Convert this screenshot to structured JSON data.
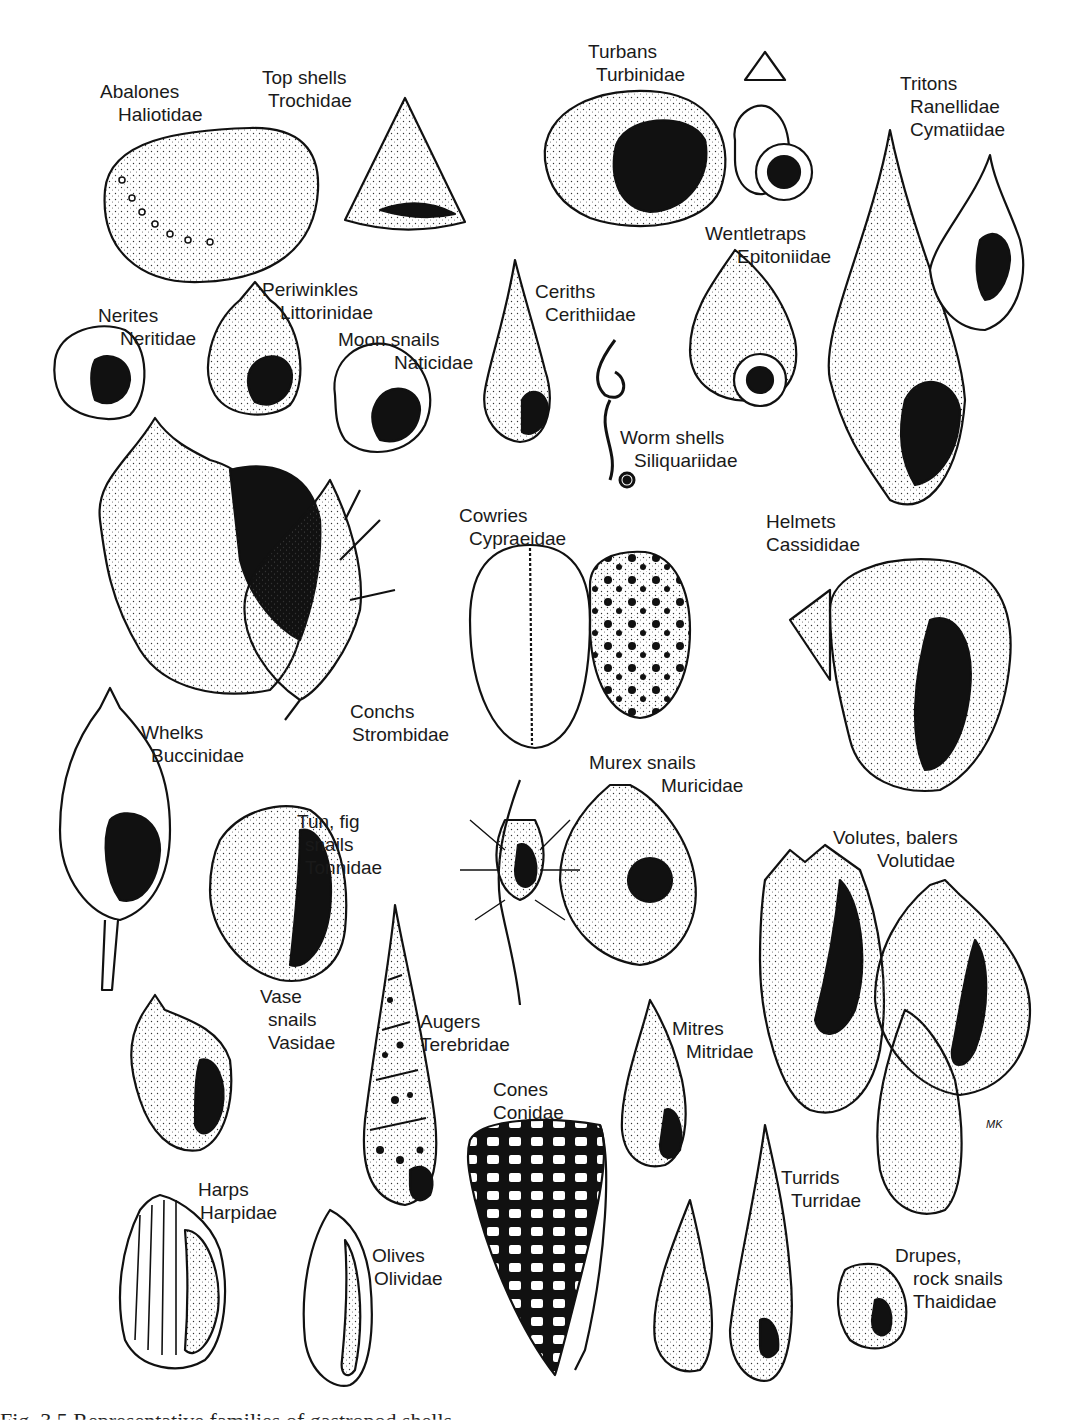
{
  "figure": {
    "caption_partial": "Fig. 3.5 Representative families of gastropod shells",
    "signature": "MK"
  },
  "labels": [
    {
      "id": "abalones",
      "common": "Abalones",
      "family": "Haliotidae",
      "x": 100,
      "y": 80,
      "indent": 18
    },
    {
      "id": "top-shells",
      "common": "Top shells",
      "family": "Trochidae",
      "x": 262,
      "y": 66,
      "indent": 6
    },
    {
      "id": "turbans",
      "common": "Turbans",
      "family": "Turbinidae",
      "x": 588,
      "y": 40,
      "indent": 8
    },
    {
      "id": "tritons",
      "common": "Tritons",
      "family": "Ranellidae",
      "family2": "Cymatiidae",
      "x": 900,
      "y": 72,
      "indent": 10
    },
    {
      "id": "wentletraps",
      "common": "Wentletraps",
      "family": "Epitoniidae",
      "x": 705,
      "y": 222,
      "indent": 32
    },
    {
      "id": "periwinkles",
      "common": "Periwinkles",
      "family": "Littorinidae",
      "x": 262,
      "y": 278,
      "indent": 18
    },
    {
      "id": "nerites",
      "common": "Nerites",
      "family": "Neritidae",
      "x": 98,
      "y": 304,
      "indent": 22
    },
    {
      "id": "moon-snails",
      "common": "Moon snails",
      "family": "Naticidae",
      "x": 338,
      "y": 328,
      "indent": 56
    },
    {
      "id": "ceriths",
      "common": "Ceriths",
      "family": "Cerithiidae",
      "x": 535,
      "y": 280,
      "indent": 10
    },
    {
      "id": "worm-shells",
      "common": "Worm shells",
      "family": "Siliquariidae",
      "x": 620,
      "y": 426,
      "indent": 14
    },
    {
      "id": "cowries",
      "common": "Cowries",
      "family": "Cypraeidae",
      "x": 459,
      "y": 504,
      "indent": 10
    },
    {
      "id": "helmets",
      "common": "Helmets",
      "family": "Cassididae",
      "x": 766,
      "y": 510,
      "indent": -8
    },
    {
      "id": "conchs",
      "common": "Conchs",
      "family": "Strombidae",
      "x": 350,
      "y": 700,
      "indent": 2
    },
    {
      "id": "whelks",
      "common": "Whelks",
      "family": "Buccinidae",
      "x": 141,
      "y": 721,
      "indent": 10
    },
    {
      "id": "murex",
      "common": "Murex snails",
      "family": "Muricidae",
      "x": 589,
      "y": 751,
      "indent": 72
    },
    {
      "id": "tun-fig",
      "common": "Tun, fig",
      "family": "snails",
      "family2": "Tonnidae",
      "x": 297,
      "y": 810,
      "indent": 8
    },
    {
      "id": "volutes",
      "common": "Volutes, balers",
      "family": "Volutidae",
      "x": 833,
      "y": 826,
      "indent": 44
    },
    {
      "id": "vase",
      "common": "Vase",
      "family": "snails",
      "family2": "Vasidae",
      "x": 260,
      "y": 985,
      "indent": 8
    },
    {
      "id": "augers",
      "common": "Augers",
      "family": "Terebridae",
      "x": 420,
      "y": 1010,
      "indent": 0
    },
    {
      "id": "mitres",
      "common": "Mitres",
      "family": "Mitridae",
      "x": 672,
      "y": 1017,
      "indent": 14
    },
    {
      "id": "cones",
      "common": "Cones",
      "family": "Conidae",
      "x": 493,
      "y": 1078,
      "indent": -8
    },
    {
      "id": "harps",
      "common": "Harps",
      "family": "Harpidae",
      "x": 198,
      "y": 1178,
      "indent": 2
    },
    {
      "id": "olives",
      "common": "Olives",
      "family": "Olividae",
      "x": 372,
      "y": 1244,
      "indent": 2
    },
    {
      "id": "turrids",
      "common": "Turrids",
      "family": "Turridae",
      "x": 781,
      "y": 1166,
      "indent": 10
    },
    {
      "id": "drupes",
      "common": "Drupes,",
      "family": "rock snails",
      "family2": "Thaididae",
      "x": 895,
      "y": 1244,
      "indent": 18
    }
  ]
}
